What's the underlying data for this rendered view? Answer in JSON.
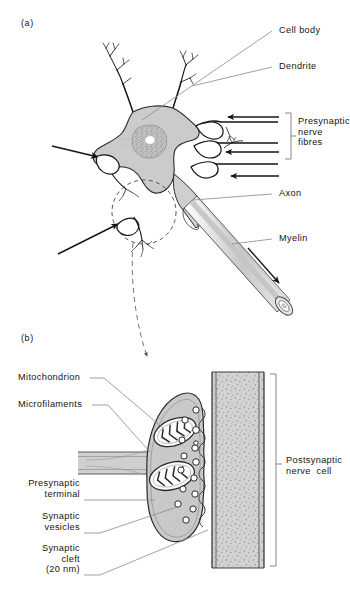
{
  "figure": {
    "panels": [
      {
        "tag": "(a)",
        "name": "panel-a-neuron-overview"
      },
      {
        "tag": "(b)",
        "name": "panel-b-synapse-detail"
      }
    ]
  },
  "panel_a": {
    "tag": "(a)",
    "labels": {
      "cell_body": "Cell body",
      "dendrite": "Dendrite",
      "presynaptic_nerve_fibres": "Presynaptic\nnerve\nfibres",
      "axon": "Axon",
      "myelin": "Myelin"
    }
  },
  "panel_b": {
    "tag": "(b)",
    "labels": {
      "mitochondrion": "Mitochondrion",
      "microfilaments": "Microfilaments",
      "presynaptic_terminal": "Presynaptic\nterminal",
      "synaptic_vesicles": "Synaptic\nvesicles",
      "synaptic_cleft": "Synaptic\ncleft\n(20 nm)",
      "postsynaptic_nerve_cell": "Postsynaptic\nnerve  cell"
    }
  },
  "colors": {
    "ink": "#141414",
    "leader": "#8a8a8a",
    "cell_fill": "#c9c9c9",
    "cell_fill_light": "#d6d6d6",
    "membrane": "#5a5a5a",
    "stipple": "#6f6f6f",
    "white": "#ffffff"
  }
}
